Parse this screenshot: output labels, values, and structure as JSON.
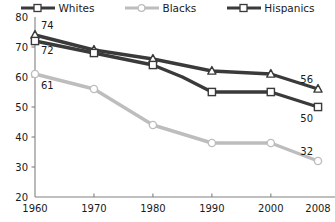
{
  "chart_data": {
    "type": "line",
    "title": "",
    "subtitle": "",
    "xlabel": "",
    "ylabel": "",
    "x": [
      1960,
      1970,
      1980,
      1990,
      2000,
      2008
    ],
    "xtick_labels": [
      "1960",
      "1970",
      "1980",
      "1990",
      "2000",
      "2008"
    ],
    "ytick_labels": [
      "20",
      "30",
      "40",
      "50",
      "60",
      "70",
      "80"
    ],
    "yticks": [
      20,
      30,
      40,
      50,
      60,
      70,
      80
    ],
    "ylim": [
      20,
      80
    ],
    "grid": false,
    "legend_position": "top",
    "series": [
      {
        "name": "Whites",
        "color": "#3a3a3a",
        "marker": "square",
        "values": [
          72,
          68,
          64,
          60,
          55,
          55,
          50
        ],
        "x": [
          1960,
          1970,
          1980,
          1985,
          1990,
          2000,
          2008
        ],
        "point_labels": [
          {
            "x": 1960,
            "value": 72,
            "text": "72"
          },
          {
            "x": 2008,
            "value": 50,
            "text": "50"
          }
        ]
      },
      {
        "name": "Blacks",
        "color": "#bdbdbd",
        "marker": "circle",
        "values": [
          61,
          56,
          44,
          38,
          38,
          32
        ],
        "x": [
          1960,
          1970,
          1980,
          1990,
          2000,
          2008
        ],
        "point_labels": [
          {
            "x": 1960,
            "value": 61,
            "text": "61"
          },
          {
            "x": 2008,
            "value": 32,
            "text": "32"
          }
        ]
      },
      {
        "name": "Hispanics",
        "color": "#3a3a3a",
        "marker": "triangle",
        "values": [
          74,
          69,
          66,
          62,
          61,
          56
        ],
        "x": [
          1960,
          1970,
          1980,
          1990,
          2000,
          2008
        ],
        "point_labels": [
          {
            "x": 1960,
            "value": 74,
            "text": "74"
          },
          {
            "x": 2008,
            "value": 56,
            "text": "56"
          }
        ]
      }
    ]
  },
  "legend": {
    "items": [
      {
        "label": "Whites",
        "color": "#3a3a3a",
        "marker": "square"
      },
      {
        "label": "Blacks",
        "color": "#bdbdbd",
        "marker": "circle"
      },
      {
        "label": "Hispanics",
        "color": "#3a3a3a",
        "marker": "triangle"
      }
    ]
  },
  "axes": {
    "y_labels": [
      "80",
      "70",
      "60",
      "50",
      "40",
      "30",
      "20"
    ],
    "x_labels": [
      "1960",
      "1970",
      "1980",
      "1990",
      "2000",
      "2008"
    ],
    "axis_color": "#808080"
  }
}
